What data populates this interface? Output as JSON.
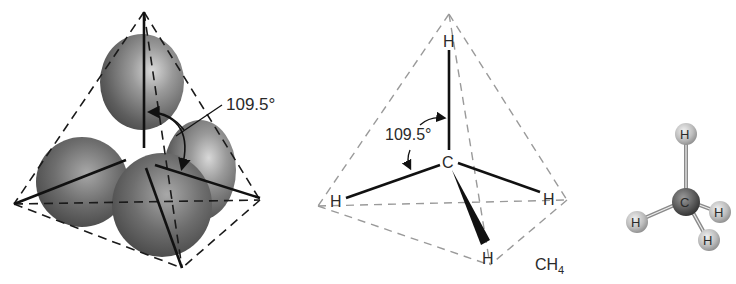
{
  "panels": {
    "orbital_model": {
      "angle_label": "109.5°"
    },
    "structural_formula": {
      "angle_label": "109.5°",
      "center_atom": "C",
      "atoms": [
        "H",
        "H",
        "H",
        "H"
      ],
      "formula_main": "CH",
      "formula_subscript": "4"
    },
    "ball_and_stick": {
      "center_atom": "C",
      "atoms": [
        "H",
        "H",
        "H",
        "H"
      ]
    }
  },
  "colors": {
    "bond": "#111111",
    "dash_dark": "#1a1a1a",
    "dash_light": "#9a9a9a",
    "lobe": "#7a7a7a",
    "carbon": "#555555",
    "hydrogen": "#c8c8c8"
  }
}
